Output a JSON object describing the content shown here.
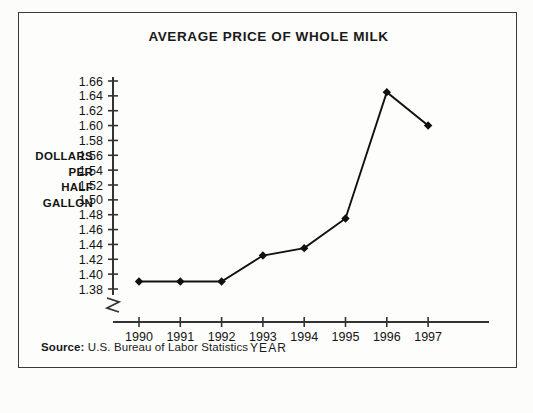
{
  "figure": {
    "title": "AVERAGE PRICE OF WHOLE MILK",
    "source_label": "Source:",
    "source_text": "U.S. Bureau of Labor Statistics",
    "border_color": "#3a3a3a",
    "background_color": "#fdfdfb",
    "ylabel_lines": [
      "DOLLARS",
      "PER",
      "HALF",
      "GALLON"
    ]
  },
  "chart_data": {
    "type": "line",
    "title": "AVERAGE PRICE OF WHOLE MILK",
    "xlabel": "YEAR",
    "ylabel": "DOLLARS PER HALF GALLON",
    "categories": [
      "1990",
      "1991",
      "1992",
      "1993",
      "1994",
      "1995",
      "1996",
      "1997"
    ],
    "x": [
      1990,
      1991,
      1992,
      1993,
      1994,
      1995,
      1996,
      1997
    ],
    "values": [
      1.39,
      1.39,
      1.39,
      1.425,
      1.435,
      1.475,
      1.645,
      1.6
    ],
    "series": [
      {
        "name": "Average price of whole milk",
        "values": [
          1.39,
          1.39,
          1.39,
          1.425,
          1.435,
          1.475,
          1.645,
          1.6
        ]
      }
    ],
    "ylim": [
      1.37,
      1.67
    ],
    "ytick_values": [
      1.38,
      1.4,
      1.42,
      1.44,
      1.46,
      1.48,
      1.5,
      1.52,
      1.54,
      1.56,
      1.58,
      1.6,
      1.62,
      1.64,
      1.66
    ],
    "ytick_labels": [
      "1.38",
      "1.40",
      "1.42",
      "1.44",
      "1.46",
      "1.48",
      "1.50",
      "1.52",
      "1.54",
      "1.56",
      "1.58",
      "1.60",
      "1.62",
      "1.64",
      "1.66"
    ],
    "xtick_labels": [
      "1990",
      "1991",
      "1992",
      "1993",
      "1994",
      "1995",
      "1996",
      "1997"
    ],
    "grid": false,
    "legend": "none",
    "axis_break": true,
    "axis_break_note": "zigzag break on y-axis below 1.38",
    "marker": "diamond",
    "line_color": "#111111",
    "marker_color": "#111111",
    "axis_color": "#333333"
  }
}
